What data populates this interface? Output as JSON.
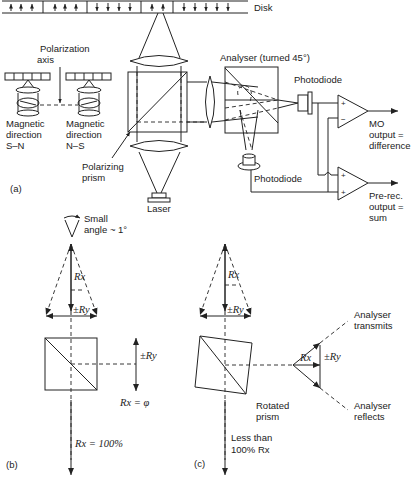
{
  "figure": {
    "panel_a": {
      "label": "(a)",
      "disk_label": "Disk",
      "polarization_axis": [
        "Polarization",
        "axis"
      ],
      "magnetic_sn": [
        "Magnetic",
        "direction",
        "S–N"
      ],
      "magnetic_ns": [
        "Magnetic",
        "direction",
        "N–S"
      ],
      "polarizing_prism": [
        "Polarizing",
        "prism"
      ],
      "laser": "Laser",
      "analyser": "Analyser (turned 45°)",
      "photodiode_top": "Photodiode",
      "photodiode_bottom": "Photodiode",
      "mo_output": [
        "MO",
        "output =",
        "difference"
      ],
      "prerec_output": [
        "Pre-rec.",
        "output =",
        "sum"
      ],
      "amp_top_inputs": [
        "+",
        "−"
      ],
      "amp_bottom_inputs": [
        "+",
        "+"
      ]
    },
    "panel_b": {
      "label": "(b)",
      "small_angle": [
        "Small",
        "angle ~ 1°"
      ],
      "rx": "Rx",
      "pm_ry": "±Ry",
      "pm_ry_side": "±Ry",
      "rx_phi": "Rx = φ",
      "rx_100": "Rx = 100%"
    },
    "panel_c": {
      "label": "(c)",
      "rx": "Rx",
      "pm_ry": "±Ry",
      "rx_side": "Rx",
      "pm_ry_side": "±Ry",
      "analyser_transmits": [
        "Analyser",
        "transmits"
      ],
      "analyser_reflects": [
        "Analyser",
        "reflects"
      ],
      "rotated_prism": [
        "Rotated",
        "prism"
      ],
      "less_than": [
        "Less than",
        "100% Rx"
      ]
    }
  }
}
